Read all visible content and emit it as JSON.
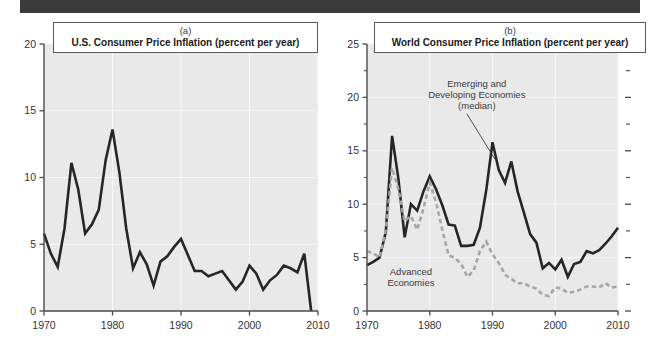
{
  "figure": {
    "banner_color": "#3b3b3b",
    "plot_background": "#e9e9e9",
    "solid_series_color": "#262626",
    "dashed_series_color": "#a6a6a6"
  },
  "chart_data": [
    {
      "id": "panel-a",
      "type": "line",
      "panel_letter": "(a)",
      "title": "U.S. Consumer Price Inflation (percent per year)",
      "xlabel": "",
      "ylabel": "",
      "xlim": [
        1970,
        2010
      ],
      "ylim": [
        0,
        20
      ],
      "xticks": [
        1970,
        1980,
        1990,
        2000,
        2010
      ],
      "xtick_labels": [
        "1970",
        "1980",
        "1990",
        "2000",
        "2010"
      ],
      "yticks": [
        0,
        5,
        10,
        15,
        20
      ],
      "ytick_labels": [
        "0",
        "5",
        "10",
        "15",
        "20"
      ],
      "grid": true,
      "legend_position": "none",
      "series": [
        {
          "name": "U.S. Consumer Price Inflation",
          "style": "solid",
          "color": "#262626",
          "x": [
            1970,
            1971,
            1972,
            1973,
            1974,
            1975,
            1976,
            1977,
            1978,
            1979,
            1980,
            1981,
            1982,
            1983,
            1984,
            1985,
            1986,
            1987,
            1988,
            1989,
            1990,
            1991,
            1992,
            1993,
            1994,
            1995,
            1996,
            1997,
            1998,
            1999,
            2000,
            2001,
            2002,
            2003,
            2004,
            2005,
            2006,
            2007,
            2008,
            2009
          ],
          "y": [
            5.8,
            4.3,
            3.3,
            6.2,
            11.1,
            9.1,
            5.8,
            6.5,
            7.6,
            11.3,
            13.6,
            10.4,
            6.2,
            3.2,
            4.4,
            3.5,
            1.9,
            3.7,
            4.1,
            4.8,
            5.4,
            4.2,
            3.0,
            3.0,
            2.6,
            2.8,
            3.0,
            2.3,
            1.6,
            2.2,
            3.4,
            2.8,
            1.6,
            2.3,
            2.7,
            3.4,
            3.2,
            2.9,
            4.3,
            -0.4,
            2.0
          ]
        }
      ]
    },
    {
      "id": "panel-b",
      "type": "line",
      "panel_letter": "(b)",
      "title": "World Consumer Price Inflation (percent per year)",
      "xlabel": "",
      "ylabel": "",
      "xlim": [
        1970,
        2010
      ],
      "ylim": [
        0,
        25
      ],
      "xticks": [
        1970,
        1980,
        1990,
        2000,
        2010
      ],
      "xtick_labels": [
        "1970",
        "1980",
        "1990",
        "2000",
        "2010"
      ],
      "yticks": [
        0,
        5,
        10,
        15,
        20,
        25
      ],
      "ytick_labels": [
        "0",
        "5",
        "10",
        "15",
        "20",
        "25"
      ],
      "yticks_minor": [
        2.5,
        7.5,
        12.5,
        17.5,
        22.5
      ],
      "grid": true,
      "legend_position": "inline-annotations",
      "annotations": [
        {
          "id": "emerging-label",
          "text_lines": [
            "Emerging and",
            "Developing Economies",
            "(median)"
          ],
          "x": 1987.5,
          "y": 21.0,
          "leader_to": {
            "x": 1990.4,
            "y": 14.2
          }
        },
        {
          "id": "advanced-label",
          "text_lines": [
            "Advanced",
            "Economies"
          ],
          "x": 1977.0,
          "y": 3.4,
          "leader_to": null
        }
      ],
      "series": [
        {
          "name": "Emerging and Developing Economies (median)",
          "style": "solid",
          "color": "#262626",
          "x": [
            1970,
            1971,
            1972,
            1973,
            1974,
            1975,
            1976,
            1977,
            1978,
            1979,
            1980,
            1981,
            1982,
            1983,
            1984,
            1985,
            1986,
            1987,
            1988,
            1989,
            1990,
            1991,
            1992,
            1993,
            1994,
            1995,
            1996,
            1997,
            1998,
            1999,
            2000,
            2001,
            2002,
            2003,
            2004,
            2005,
            2006,
            2007,
            2008,
            2009,
            2010
          ],
          "y": [
            4.3,
            4.6,
            5.0,
            7.4,
            16.4,
            12.4,
            6.9,
            10.0,
            9.4,
            11.2,
            12.6,
            11.4,
            9.9,
            8.1,
            8.0,
            6.1,
            6.1,
            6.2,
            7.8,
            11.3,
            15.8,
            13.2,
            12.0,
            14.0,
            11.2,
            9.2,
            7.2,
            6.4,
            4.0,
            4.5,
            3.9,
            4.8,
            3.2,
            4.4,
            4.6,
            5.6,
            5.4,
            5.7,
            6.3,
            7.0,
            7.8
          ]
        },
        {
          "name": "Advanced Economies",
          "style": "dashed",
          "color": "#a6a6a6",
          "x": [
            1970,
            1971,
            1972,
            1973,
            1974,
            1975,
            1976,
            1977,
            1978,
            1979,
            1980,
            1981,
            1982,
            1983,
            1984,
            1985,
            1986,
            1987,
            1988,
            1989,
            1990,
            1991,
            1992,
            1993,
            1994,
            1995,
            1996,
            1997,
            1998,
            1999,
            2000,
            2001,
            2002,
            2003,
            2004,
            2005,
            2006,
            2007,
            2008,
            2009,
            2010
          ],
          "y": [
            5.6,
            5.4,
            5.0,
            7.6,
            13.4,
            11.4,
            8.4,
            8.9,
            7.6,
            9.6,
            12.0,
            10.2,
            7.6,
            5.2,
            5.0,
            4.4,
            3.2,
            3.8,
            5.6,
            6.5,
            5.3,
            4.5,
            3.4,
            3.0,
            2.6,
            2.6,
            2.3,
            2.1,
            1.5,
            1.4,
            2.2,
            2.1,
            1.7,
            1.8,
            2.0,
            2.3,
            2.3,
            2.2,
            2.6,
            2.2,
            2.3
          ]
        }
      ]
    }
  ]
}
